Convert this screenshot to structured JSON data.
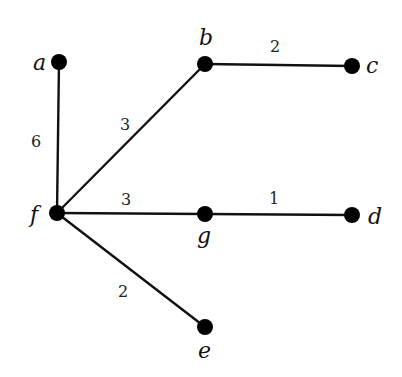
{
  "diagram": {
    "type": "weighted-undirected-graph",
    "nodes": [
      {
        "id": "a",
        "label": "a",
        "x": 59,
        "y": 62,
        "label_x": 33,
        "label_y": 70
      },
      {
        "id": "b",
        "label": "b",
        "x": 205,
        "y": 64,
        "label_x": 199,
        "label_y": 45
      },
      {
        "id": "c",
        "label": "c",
        "x": 352,
        "y": 66,
        "label_x": 366,
        "label_y": 73
      },
      {
        "id": "f",
        "label": "f",
        "x": 57,
        "y": 213,
        "label_x": 30,
        "label_y": 222
      },
      {
        "id": "g",
        "label": "g",
        "x": 205,
        "y": 214,
        "label_x": 197,
        "label_y": 243
      },
      {
        "id": "d",
        "label": "d",
        "x": 352,
        "y": 215,
        "label_x": 368,
        "label_y": 224
      },
      {
        "id": "e",
        "label": "e",
        "x": 205,
        "y": 327,
        "label_x": 198,
        "label_y": 358
      }
    ],
    "edges": [
      {
        "from": "a",
        "to": "f",
        "weight": "6",
        "label_x": 36,
        "label_y": 147
      },
      {
        "from": "f",
        "to": "b",
        "weight": "3",
        "label_x": 125,
        "label_y": 130
      },
      {
        "from": "b",
        "to": "c",
        "weight": "2",
        "label_x": 275,
        "label_y": 52
      },
      {
        "from": "f",
        "to": "g",
        "weight": "3",
        "label_x": 126,
        "label_y": 205
      },
      {
        "from": "g",
        "to": "d",
        "weight": "1",
        "label_x": 274,
        "label_y": 204
      },
      {
        "from": "f",
        "to": "e",
        "weight": "2",
        "label_x": 123,
        "label_y": 297
      }
    ]
  }
}
